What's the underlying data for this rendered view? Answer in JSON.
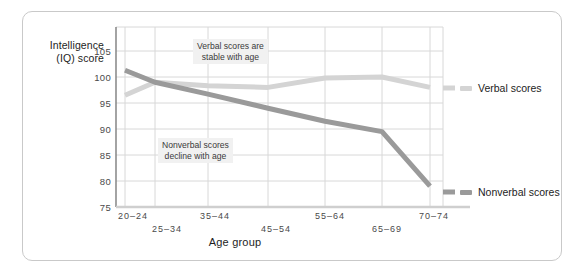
{
  "chart_data": {
    "type": "line",
    "title": "",
    "xlabel": "Age group",
    "ylabel": "Intelligence (IQ) score",
    "ylim": [
      75,
      107
    ],
    "yticks": [
      75,
      80,
      85,
      90,
      95,
      100,
      105
    ],
    "grid": true,
    "legend_position": "right",
    "categories": [
      "20–24",
      "25–34",
      "35–44",
      "45–54",
      "55–64",
      "65–69",
      "70–74"
    ],
    "series": [
      {
        "name": "Verbal scores",
        "color": "#d4d4d4",
        "values": [
          96.5,
          99.0,
          98.3,
          98.0,
          99.8,
          100.0,
          98.0
        ]
      },
      {
        "name": "Nonverbal scores",
        "color": "#9a9a9a",
        "values": [
          101.3,
          99.0,
          96.7,
          94.0,
          91.5,
          89.5,
          79.0
        ]
      }
    ],
    "annotations": [
      {
        "text_line1": "Verbal scores are",
        "text_line2": "stable with age"
      },
      {
        "text_line1": "Nonverbal scores",
        "text_line2": "decline with age"
      }
    ]
  },
  "axis": {
    "y_label_line1": "Intelligence",
    "y_label_line2": "(IQ) score",
    "x_title": "Age group",
    "y_ticks": [
      "105",
      "100",
      "95",
      "90",
      "85",
      "80",
      "75"
    ],
    "x_ticks": [
      "20–24",
      "25–34",
      "35–44",
      "45–54",
      "55–64",
      "65–69",
      "70–74"
    ]
  },
  "legend": {
    "items": [
      {
        "label": "Verbal scores",
        "color": "#d4d4d4"
      },
      {
        "label": "Nonverbal scores",
        "color": "#9a9a9a"
      }
    ]
  },
  "colors": {
    "verbal": "#d4d4d4",
    "nonverbal": "#9a9a9a",
    "grid": "#d8d8d8",
    "axis": "#808080",
    "card_border": "#c9c9c9",
    "annotation_bg": "#f1f1f1",
    "text": "#1d1d1d"
  }
}
